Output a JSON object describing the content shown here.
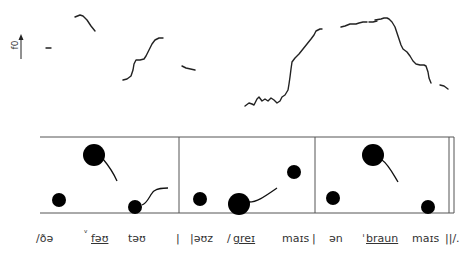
{
  "axis": {
    "label": "f0",
    "arrow": "up-arrow"
  },
  "pitch_track": {
    "segments": [
      {
        "id": "seg1",
        "points": "46,48 51,48"
      },
      {
        "id": "seg2",
        "points": "75,17 80,15 83,16 87,20 91,26 95,31"
      },
      {
        "id": "seg3",
        "points": "123,80 127,79 131,76 133,70 134,64 136,60 140,60 144,59 146,56 149,50 152,44 155,40 159,38 163,38"
      },
      {
        "id": "seg4",
        "points": "182,66 186,68 195,70"
      },
      {
        "id": "seg5",
        "points": "245,106 249,103 252,104 254,105 257,99 259,97 262,101 265,99 268,101 271,98 274,100 277,103 280,101 282,97 285,95 288,90 289,84 290,77 291,69 292,62 295,58 299,54 303,49 307,44 311,39 314,35 316,31 320,29 322,29"
      },
      {
        "id": "seg6",
        "points": "341,27 345,26 350,24 356,24 359,23 363,22 367,22"
      },
      {
        "id": "seg7",
        "points": "369,22 373,22 377,21"
      },
      {
        "id": "seg8",
        "points": "375,20 381,19 384,18 387,18 389,19 392,22 395,27 397,33 399,39 401,45 403,49 407,52 410,56 413,61 416,64 420,65 424,65 426,66 428,72 429,78 431,83"
      },
      {
        "id": "seg9",
        "points": "440,85 444,86 448,89"
      }
    ]
  },
  "stylization": {
    "frame": {
      "left": 40,
      "top": 137,
      "right": 449,
      "bottom": 213,
      "dividers": [
        179,
        315
      ],
      "end_bar": 454
    },
    "dots": [
      {
        "cx": 59,
        "cy": 200,
        "r": 7,
        "size": "small"
      },
      {
        "cx": 94,
        "cy": 155,
        "r": 11,
        "size": "large",
        "tail": "M103,159 C108,165 113,172 117,181"
      },
      {
        "cx": 135,
        "cy": 207,
        "r": 7,
        "size": "small",
        "tail": "M142,205 C148,203 150,194 154,191 C158,188 162,188 168,188"
      },
      {
        "cx": 200,
        "cy": 199,
        "r": 7,
        "size": "small"
      },
      {
        "cx": 239,
        "cy": 204,
        "r": 11,
        "size": "large",
        "tail": "M249,202 C257,202 264,197 277,188"
      },
      {
        "cx": 294,
        "cy": 172,
        "r": 7,
        "size": "small"
      },
      {
        "cx": 333,
        "cy": 198,
        "r": 7,
        "size": "small"
      },
      {
        "cx": 373,
        "cy": 155,
        "r": 11,
        "size": "large",
        "tail": "M382,160 C388,164 392,172 398,182"
      },
      {
        "cx": 428,
        "cy": 207,
        "r": 7,
        "size": "small"
      }
    ]
  },
  "transcription": [
    {
      "text": "/ðə",
      "x": 36,
      "underline": false
    },
    {
      "text": "ᵛ",
      "x": 84,
      "underline": false,
      "sup": true
    },
    {
      "text": "fəʊ",
      "x": 91,
      "underline": true
    },
    {
      "text": "təʊ",
      "x": 128,
      "underline": false
    },
    {
      "text": "|",
      "x": 176,
      "underline": false
    },
    {
      "text": "|əʊz",
      "x": 190,
      "underline": false
    },
    {
      "text": "/",
      "x": 227,
      "underline": false
    },
    {
      "text": "greɪ",
      "x": 233,
      "underline": true
    },
    {
      "text": "maɪs",
      "x": 282,
      "underline": false
    },
    {
      "text": "|",
      "x": 312,
      "underline": false
    },
    {
      "text": "ən",
      "x": 329,
      "underline": false
    },
    {
      "text": "ˈ",
      "x": 362,
      "underline": false
    },
    {
      "text": "braun",
      "x": 366,
      "underline": true
    },
    {
      "text": "maɪs",
      "x": 412,
      "underline": false
    },
    {
      "text": "||/.",
      "x": 445,
      "underline": false
    }
  ]
}
